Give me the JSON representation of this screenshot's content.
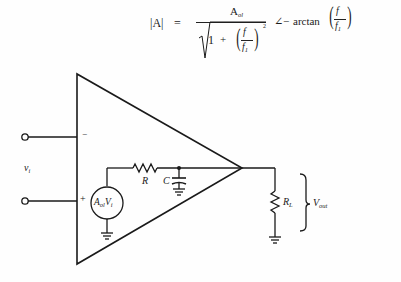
{
  "formula": {
    "lhs": "|A|",
    "equals": "=",
    "numerator": "A",
    "numerator_sub": "ol",
    "denominator_one": "1",
    "denominator_plus": "+",
    "frac_num": "f",
    "frac_den": "f",
    "frac_den_sub": "1",
    "exponent": "2",
    "angle": "∠",
    "minus": "−",
    "arctan": "arctan",
    "arc_num": "f",
    "arc_den": "f",
    "arc_den_sub": "1"
  },
  "circuit": {
    "input_label": "v",
    "input_label_sub": "i",
    "minus_terminal": "−",
    "plus_terminal": "+",
    "source_label_main": "A",
    "source_label_sub": "ol",
    "source_label_v": "V",
    "source_label_v_sub": "i",
    "resistor_label": "R",
    "capacitor_label": "C",
    "load_label": "R",
    "load_label_sub": "L",
    "output_label": "V",
    "output_label_sub": "out"
  }
}
